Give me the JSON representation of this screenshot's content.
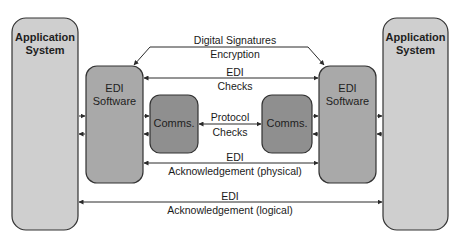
{
  "diagram": {
    "left_app": {
      "line1": "Application",
      "line2": "System"
    },
    "right_app": {
      "line1": "Application",
      "line2": "System"
    },
    "left_edi": {
      "line1": "EDI",
      "line2": "Software"
    },
    "right_edi": {
      "line1": "EDI",
      "line2": "Software"
    },
    "left_comms": {
      "label": "Comms."
    },
    "right_comms": {
      "label": "Comms."
    },
    "connections": {
      "security": {
        "line1": "Digital Signatures",
        "line2": "Encryption"
      },
      "edi_checks": {
        "line1": "EDI",
        "line2": "Checks"
      },
      "protocol": {
        "line1": "Protocol",
        "line2": "Checks"
      },
      "ack_physical": {
        "line1": "EDI",
        "line2": "Acknowledgement (physical)"
      },
      "ack_logical": {
        "line1": "EDI",
        "line2": "Acknowledgement (logical)"
      }
    },
    "colors": {
      "app_fill": "#cfcfcf",
      "edi_fill": "#a9a9a9",
      "comms_fill": "#8f8f8f",
      "stroke": "#333333"
    }
  }
}
